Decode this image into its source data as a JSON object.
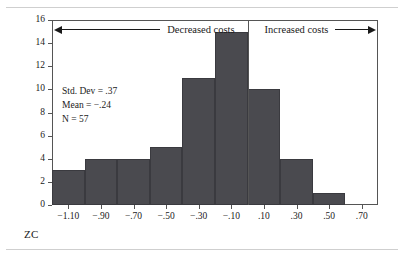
{
  "chart_data": {
    "type": "bar",
    "title": "",
    "xlabel": "ZC",
    "ylabel": "",
    "xlim": [
      -1.2,
      0.8
    ],
    "ylim": [
      0,
      16
    ],
    "grid": false,
    "legend": "none",
    "bin_width": 0.2,
    "categories": [
      "-1.10",
      "-0.90",
      "-0.70",
      "-0.50",
      "-0.30",
      "-0.10",
      "0.10",
      "0.30",
      "0.50",
      "0.70"
    ],
    "values": [
      3,
      4,
      4,
      5,
      11,
      15,
      10,
      4,
      1,
      0
    ],
    "bins": [
      {
        "center": -1.1,
        "left": -1.2,
        "right": -1.0,
        "count": 3
      },
      {
        "center": -0.9,
        "left": -1.0,
        "right": -0.8,
        "count": 4
      },
      {
        "center": -0.7,
        "left": -0.8,
        "right": -0.6,
        "count": 4
      },
      {
        "center": -0.5,
        "left": -0.6,
        "right": -0.4,
        "count": 5
      },
      {
        "center": -0.3,
        "left": -0.4,
        "right": -0.2,
        "count": 11
      },
      {
        "center": -0.1,
        "left": -0.2,
        "right": 0.0,
        "count": 15
      },
      {
        "center": 0.1,
        "left": 0.0,
        "right": 0.2,
        "count": 10
      },
      {
        "center": 0.3,
        "left": 0.2,
        "right": 0.4,
        "count": 4
      },
      {
        "center": 0.5,
        "left": 0.4,
        "right": 0.6,
        "count": 1
      },
      {
        "center": 0.7,
        "left": 0.6,
        "right": 0.8,
        "count": 0
      }
    ],
    "yticks": [
      0,
      2,
      4,
      6,
      8,
      10,
      12,
      14,
      16
    ],
    "ytick_labels": [
      "0",
      "2",
      "4",
      "6",
      "8",
      "10",
      "12",
      "14",
      "16"
    ],
    "xticks": [
      -1.1,
      -0.9,
      -0.7,
      -0.5,
      -0.3,
      -0.1,
      0.1,
      0.3,
      0.5,
      0.7
    ],
    "xtick_labels": [
      "−1.10",
      "−.90",
      "−.70",
      "−.50",
      "−.30",
      "−.10",
      ".10",
      ".30",
      ".50",
      ".70"
    ],
    "annotations": [
      {
        "name": "decreased-costs",
        "text": "Decreased costs",
        "arrow": "left",
        "region": [
          -1.2,
          0.0
        ]
      },
      {
        "name": "increased-costs",
        "text": "Increased costs",
        "arrow": "right",
        "region": [
          0.0,
          0.8
        ]
      }
    ],
    "bar_color": "#4a4a4f",
    "axis_color": "#555555"
  },
  "stats": {
    "std_dev": "Std. Dev = .37",
    "mean": "Mean = −.24",
    "n": "N = 57"
  },
  "axis": {
    "x_title": "ZC"
  },
  "band": {
    "left_text": "Decreased costs",
    "right_text": "Increased costs"
  }
}
